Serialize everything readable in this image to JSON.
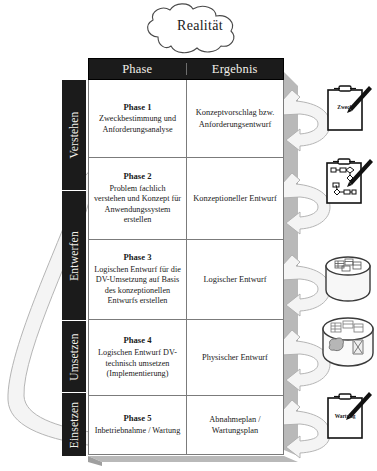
{
  "diagram": {
    "title": "Realität",
    "source_label": "Realität",
    "columns": [
      "Phase",
      "Ergebnis"
    ],
    "stages": [
      {
        "label": "Verstehen",
        "top": 0,
        "height": 110
      },
      {
        "label": "Entwerfen",
        "top": 110,
        "height": 130
      },
      {
        "label": "Umsetzen",
        "top": 240,
        "height": 72
      },
      {
        "label": "Einsetzen",
        "top": 312,
        "height": 64
      }
    ],
    "rows": [
      {
        "phase_title": "Phase 1",
        "phase_desc": "Zweckbestimmung und Anforderungsanalyse",
        "result": "Konzeptvorschlag bzw. Anforderungsentwurf",
        "icon": "clipboard-pen-icon",
        "icon_label": "Zweck"
      },
      {
        "phase_title": "Phase 2",
        "phase_desc": "Problem fachlich verstehen und Konzept für Anwendungssystem erstellen",
        "result": "Konzeptioneller Entwurf",
        "icon": "clipboard-flowchart-icon",
        "icon_label": ""
      },
      {
        "phase_title": "Phase 3",
        "phase_desc": "Logischen Entwurf für die DV-Umsetzung auf Basis des konzeptionellen Entwurfs erstellen",
        "result": "Logischer Entwurf",
        "icon": "database-schema-icon",
        "icon_label": ""
      },
      {
        "phase_title": "Phase 4",
        "phase_desc": "Logischen Entwurf DV-technisch umsetzen (Implementierung)",
        "result": "Physischer Entwurf",
        "icon": "database-physical-icon",
        "icon_label": ""
      },
      {
        "phase_title": "Phase 5",
        "phase_desc": "Inbetriebnahme / Wartung",
        "result": "Abnahmeplan / Wartungsplan",
        "icon": "clipboard-pen-icon",
        "icon_label": "Wartung"
      }
    ],
    "colors": {
      "header_bg": "#1b1b1b",
      "header_text": "#f2f0ea",
      "grid_line": "#7b7b7b",
      "arrow_fill": "#f2f2f2",
      "arrow_stroke": "#9a9a9a",
      "shadow": "#b9b9b9",
      "page_bg": "#ffffff"
    }
  }
}
